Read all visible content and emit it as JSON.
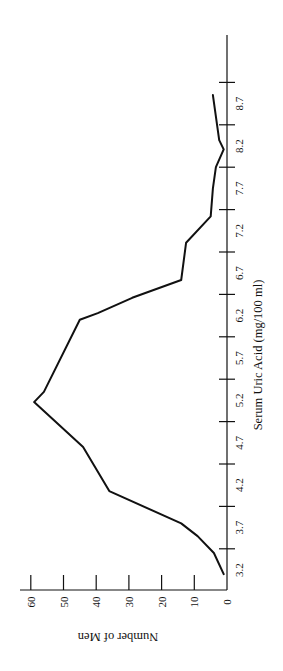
{
  "chart_data": {
    "type": "line",
    "orientation": "rotated-90-ccw",
    "title": "",
    "xlabel": "Serum Uric Acid (mg/100 ml)",
    "ylabel": "Number of Men",
    "x_tick_labels": [
      "3.2",
      "3.7",
      "4.2",
      "4.7",
      "5.2",
      "5.7",
      "6.2",
      "6.7",
      "7.2",
      "7.7",
      "8.2",
      "8.7"
    ],
    "y_tick_labels": [
      "0",
      "10",
      "20",
      "30",
      "40",
      "50",
      "60"
    ],
    "y_ticks": [
      0,
      10,
      20,
      30,
      40,
      50,
      60
    ],
    "ylim": [
      0,
      62
    ],
    "xlim": [
      3.2,
      9.2
    ],
    "grid": false,
    "legend": null,
    "series": [
      {
        "name": "Number of Men",
        "x": [
          3.15,
          3.4,
          3.6,
          3.75,
          4.13,
          4.65,
          5.18,
          5.3,
          6.15,
          6.23,
          6.41,
          6.62,
          7.06,
          7.37,
          7.7,
          7.95,
          8.16,
          8.27,
          8.8
        ],
        "values": [
          1,
          4,
          9,
          14,
          36,
          44,
          59,
          56,
          45,
          39.5,
          29,
          14,
          12.5,
          5,
          4.3,
          3.4,
          1,
          2.4,
          4.3
        ]
      }
    ]
  },
  "layout": {
    "origin_px": [
      227,
      590
    ],
    "category_first_label_y": 570,
    "category_step_px": 42.4,
    "px_per_unit_x": 84.8,
    "px_per_unit_value": 3.27,
    "line_color": "#111111",
    "axis_color": "#111111"
  }
}
